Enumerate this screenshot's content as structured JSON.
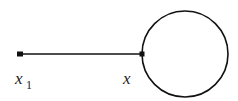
{
  "diagram": {
    "colors": {
      "stroke": "#111111",
      "background": "#ffffff",
      "text": "#222222"
    },
    "segment": {
      "x1": 20,
      "y": 54,
      "x2": 142
    },
    "circle": {
      "cx": 185,
      "cy": 54,
      "r": 43
    },
    "points": [
      {
        "id": "p1",
        "x": 20,
        "y": 54,
        "label": "x",
        "subscript": "1"
      },
      {
        "id": "p2",
        "x": 142,
        "y": 54,
        "label": "x",
        "subscript": ""
      }
    ],
    "labels": {
      "left_main": "x",
      "left_sub": "1",
      "right_main": "x"
    }
  }
}
